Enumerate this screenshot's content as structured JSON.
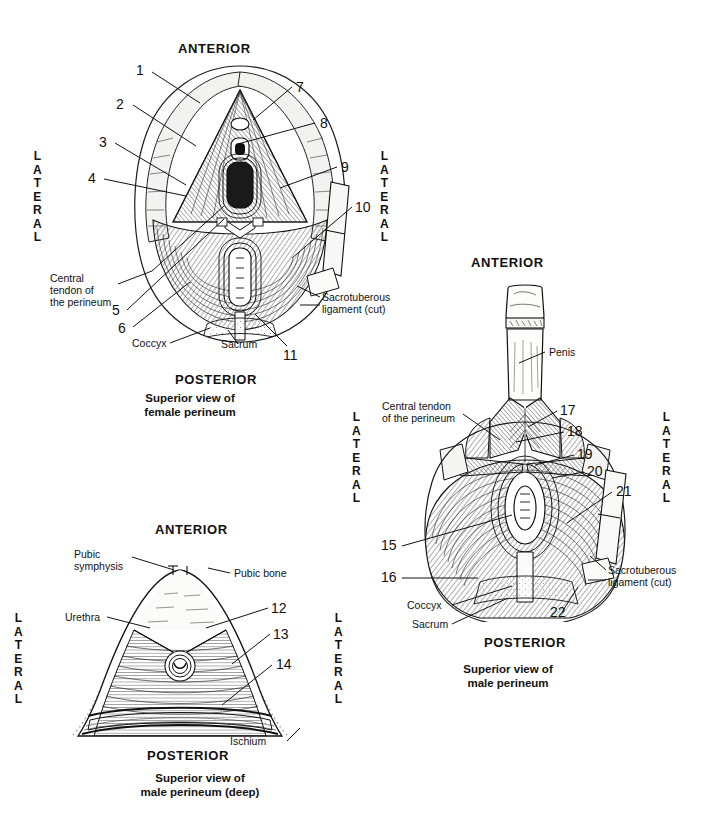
{
  "plate": {
    "title": "Superior views of the perineum",
    "background": "#ffffff",
    "ink": "#111111",
    "width": 709,
    "height": 828
  },
  "figures": [
    {
      "id": "female-perineum",
      "caption": "Superior view of\nfemale perineum",
      "orientation": {
        "anterior": "ANTERIOR",
        "posterior": "POSTERIOR",
        "lateral_left": "LATERAL",
        "lateral_right": "LATERAL"
      },
      "numbers": [
        "1",
        "2",
        "3",
        "4",
        "5",
        "6",
        "7",
        "8",
        "9",
        "10",
        "11"
      ],
      "text_labels": [
        "Central\ntendon of\nthe perineum",
        "Coccyx",
        "Sacrum",
        "Sacrotuberous\nligament (cut)"
      ]
    },
    {
      "id": "male-perineum",
      "caption": "Superior view of\nmale perineum",
      "orientation": {
        "anterior": "ANTERIOR",
        "posterior": "POSTERIOR",
        "lateral_left": "LATERAL",
        "lateral_right": "LATERAL"
      },
      "numbers": [
        "15",
        "16",
        "17",
        "18",
        "19",
        "20",
        "21",
        "22"
      ],
      "text_labels": [
        "Penis",
        "Central tendon\nof the perineum",
        "Coccyx",
        "Sacrum",
        "Sacrotuberous\nligament (cut)"
      ]
    },
    {
      "id": "male-perineum-deep",
      "caption": "Superior view of\nmale perineum (deep)",
      "orientation": {
        "anterior": "ANTERIOR",
        "posterior": "POSTERIOR",
        "lateral_left": "LATERAL",
        "lateral_right": "LATERAL"
      },
      "numbers": [
        "12",
        "13",
        "14"
      ],
      "text_labels": [
        "Pubic\nsymphysis",
        "Pubic bone",
        "Urethra",
        "Ischium"
      ]
    }
  ],
  "female": {
    "anterior": "ANTERIOR",
    "posterior": "POSTERIOR",
    "lateral_left": "LATERAL",
    "lateral_right": "LATERAL",
    "caption": "Superior view of\nfemale perineum",
    "n1": "1",
    "n2": "2",
    "n3": "3",
    "n4": "4",
    "n5": "5",
    "n6": "6",
    "n7": "7",
    "n8": "8",
    "n9": "9",
    "n10": "10",
    "n11": "11",
    "central_tendon": "Central\ntendon of\nthe perineum",
    "coccyx": "Coccyx",
    "sacrum": "Sacrum",
    "sacrotuberous": "Sacrotuberous\nligament (cut)"
  },
  "male": {
    "anterior": "ANTERIOR",
    "posterior": "POSTERIOR",
    "lateral_left": "LATERAL",
    "lateral_right": "LATERAL",
    "caption": "Superior view of\nmale perineum",
    "penis": "Penis",
    "central_tendon": "Central tendon\nof the perineum",
    "n15": "15",
    "n16": "16",
    "n17": "17",
    "n18": "18",
    "n19": "19",
    "n20": "20",
    "n21": "21",
    "n22": "22",
    "coccyx": "Coccyx",
    "sacrum": "Sacrum",
    "sacrotuberous": "Sacrotuberous\nligament (cut)"
  },
  "deep": {
    "anterior": "ANTERIOR",
    "posterior": "POSTERIOR",
    "lateral_left": "LATERAL",
    "lateral_right": "LATERAL",
    "caption": "Superior view of\nmale perineum (deep)",
    "pubic_symphysis": "Pubic\nsymphysis",
    "pubic_bone": "Pubic bone",
    "urethra": "Urethra",
    "ischium": "Ischium",
    "n12": "12",
    "n13": "13",
    "n14": "14"
  }
}
